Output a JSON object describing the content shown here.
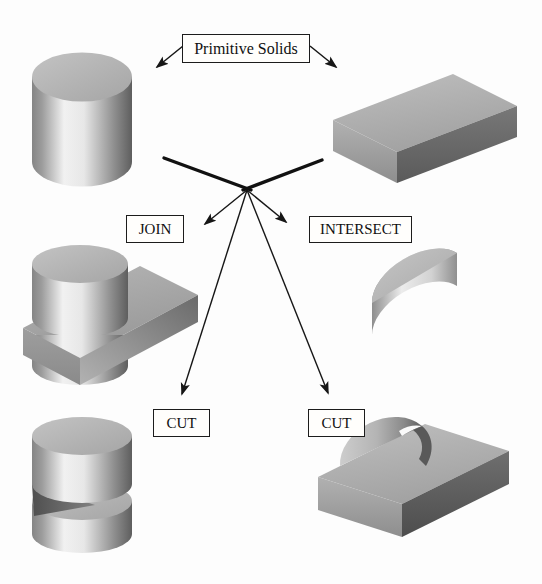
{
  "labels": {
    "primitive_solids": "Primitive Solids",
    "join": "JOIN",
    "intersect": "INTERSECT",
    "cut_left": "CUT",
    "cut_right": "CUT"
  },
  "solids": {
    "cylinder": "cylinder primitive",
    "block": "rectangular block primitive",
    "join_result": "cylinder united with block",
    "intersect_result": "half-cylinder wedge (cylinder intersect block)",
    "cut_cylinder_result": "cylinder with wedge slot cut out",
    "cut_block_result": "block with semicircular notch cut out"
  },
  "edges": [
    {
      "from": "primitive_solids_label",
      "to": "cylinder"
    },
    {
      "from": "primitive_solids_label",
      "to": "block"
    },
    {
      "from": "primitives_hub",
      "to": "join_label"
    },
    {
      "from": "primitives_hub",
      "to": "intersect_label"
    },
    {
      "from": "primitives_hub",
      "to": "cut_left_label"
    },
    {
      "from": "primitives_hub",
      "to": "cut_right_label"
    }
  ],
  "colors": {
    "background": "#fdfdfd",
    "line": "#161616",
    "label_border": "#1c1c1c",
    "face_top": "#b3b3b3",
    "face_front": "#a2a2a2",
    "face_dark": "#616161",
    "cylinder_highlight": "#f0f0f0",
    "slot_shadow": "#535353"
  }
}
